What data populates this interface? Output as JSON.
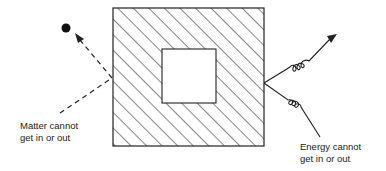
{
  "diagram": {
    "labels": {
      "matter": [
        "Matter cannot",
        "get in or out"
      ],
      "energy": [
        "Energy cannot",
        "get in or out"
      ]
    },
    "elements": {
      "outer_box": {
        "x": 113,
        "y": 8,
        "w": 151,
        "h": 138,
        "fill": "hatched"
      },
      "inner_box": {
        "x": 162,
        "y": 49,
        "w": 54,
        "h": 54,
        "fill": "#ffffff"
      },
      "matter_particle": {
        "cx": 66,
        "cy": 28,
        "r": 4.5
      },
      "matter_path": "dashed arrow reflecting off left wall",
      "energy_path": "wavy arrows reflecting off right wall"
    },
    "colors": {
      "stroke": "#222222",
      "background": "#ffffff"
    }
  }
}
